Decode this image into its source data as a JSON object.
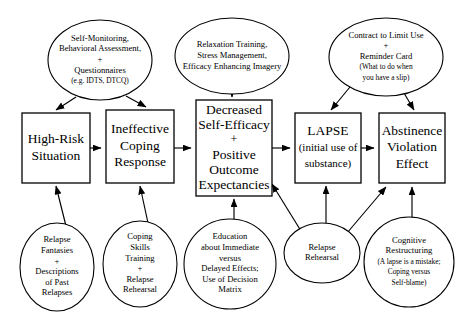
{
  "diagram": {
    "type": "flow-diagram",
    "canvas": {
      "width": 465,
      "height": 318
    },
    "colors": {
      "stroke": "#000000",
      "fill": "#ffffff",
      "text": "#000000"
    },
    "boxes": [
      {
        "id": "high-risk-situation",
        "name": "High-Risk Situation",
        "x": 22,
        "y": 113,
        "w": 68,
        "h": 70,
        "lines": [
          {
            "text": "High-Risk",
            "size": "normal"
          },
          {
            "text": "Situation",
            "size": "normal"
          }
        ]
      },
      {
        "id": "ineffective-coping-response",
        "name": "Ineffective Coping Response",
        "x": 106,
        "y": 110,
        "w": 68,
        "h": 73,
        "lines": [
          {
            "text": "Ineffective",
            "size": "normal"
          },
          {
            "text": "Coping",
            "size": "normal"
          },
          {
            "text": "Response",
            "size": "normal"
          }
        ]
      },
      {
        "id": "decreased-self-efficacy",
        "name": "Decreased Self-Efficacy + Positive Outcome Expectancies",
        "x": 196,
        "y": 100,
        "w": 76,
        "h": 96,
        "lines": [
          {
            "text": "Decreased",
            "size": "normal"
          },
          {
            "text": "Self-Efficacy",
            "size": "normal"
          },
          {
            "text": "+",
            "size": "plus"
          },
          {
            "text": "Positive",
            "size": "normal"
          },
          {
            "text": "Outcome",
            "size": "normal"
          },
          {
            "text": "Expectancies",
            "size": "normal"
          }
        ]
      },
      {
        "id": "lapse",
        "name": "LAPSE (initial use of substance)",
        "x": 295,
        "y": 113,
        "w": 66,
        "h": 70,
        "lines": [
          {
            "text": "LAPSE",
            "size": "normal"
          },
          {
            "text": "(initial use of",
            "size": "small"
          },
          {
            "text": "substance)",
            "size": "small"
          }
        ]
      },
      {
        "id": "abstinence-violation-effect",
        "name": "Abstinence Violation Effect",
        "x": 379,
        "y": 113,
        "w": 66,
        "h": 70,
        "lines": [
          {
            "text": "Abstinence",
            "size": "normal"
          },
          {
            "text": "Violation",
            "size": "normal"
          },
          {
            "text": "Effect",
            "size": "normal"
          }
        ]
      }
    ],
    "ellipses": [
      {
        "id": "self-monitoring",
        "name": "Self-Monitoring, Behavioral Assessment + Questionnaires",
        "cx": 100,
        "cy": 60,
        "rx": 52,
        "ry": 40,
        "lines": [
          {
            "text": "Self-Monitoring,",
            "size": "normal"
          },
          {
            "text": "Behavioral Assessment,",
            "size": "normal"
          },
          {
            "text": "+",
            "size": "plus"
          },
          {
            "text": "Questionnaires",
            "size": "normal"
          },
          {
            "text": "(e.g. IDTS, DTCQ)",
            "size": "tiny"
          }
        ]
      },
      {
        "id": "relaxation-training",
        "name": "Relaxation Training, Stress Management, Efficacy Enhancing Imagery",
        "cx": 232,
        "cy": 56,
        "rx": 57,
        "ry": 38,
        "lines": [
          {
            "text": "Relaxation Training,",
            "size": "normal"
          },
          {
            "text": "Stress Management,",
            "size": "normal"
          },
          {
            "text": "Efficacy Enhancing Imagery",
            "size": "normal"
          }
        ]
      },
      {
        "id": "contract-to-limit-use",
        "name": "Contract to Limit Use + Reminder Card",
        "cx": 386,
        "cy": 57,
        "rx": 57,
        "ry": 39,
        "lines": [
          {
            "text": "Contract to Limit Use",
            "size": "normal"
          },
          {
            "text": "+",
            "size": "plus"
          },
          {
            "text": "Reminder Card",
            "size": "normal"
          },
          {
            "text": "(What to do when",
            "size": "tiny"
          },
          {
            "text": "you have a slip)",
            "size": "tiny"
          }
        ]
      },
      {
        "id": "relapse-fantasies",
        "name": "Relapse Fantasies + Descriptions of Past Relapses",
        "cx": 57,
        "cy": 267,
        "rx": 37,
        "ry": 44,
        "lines": [
          {
            "text": "Relapse",
            "size": "normal"
          },
          {
            "text": "Fantasies",
            "size": "normal"
          },
          {
            "text": "+",
            "size": "plus"
          },
          {
            "text": "Descriptions",
            "size": "normal"
          },
          {
            "text": "of Past",
            "size": "normal"
          },
          {
            "text": "Relapses",
            "size": "normal"
          }
        ]
      },
      {
        "id": "coping-skills-training",
        "name": "Coping Skills Training + Relapse Rehearsal",
        "cx": 140,
        "cy": 264,
        "rx": 37,
        "ry": 43,
        "lines": [
          {
            "text": "Coping",
            "size": "normal"
          },
          {
            "text": "Skills",
            "size": "normal"
          },
          {
            "text": "Training",
            "size": "normal"
          },
          {
            "text": "+",
            "size": "plus"
          },
          {
            "text": "Relapse",
            "size": "normal"
          },
          {
            "text": "Rehearsal",
            "size": "normal"
          }
        ]
      },
      {
        "id": "education-immediate-delayed",
        "name": "Education about Immediate versus Delayed Effects; Use of Decision Matrix",
        "cx": 230,
        "cy": 264,
        "rx": 46,
        "ry": 45,
        "lines": [
          {
            "text": "Education",
            "size": "normal"
          },
          {
            "text": "about Immediate",
            "size": "normal"
          },
          {
            "text": "versus",
            "size": "normal"
          },
          {
            "text": "Delayed Effects;",
            "size": "normal"
          },
          {
            "text": "Use of Decision",
            "size": "normal"
          },
          {
            "text": "Matrix",
            "size": "normal"
          }
        ]
      },
      {
        "id": "relapse-rehearsal",
        "name": "Relapse Rehearsal",
        "cx": 322,
        "cy": 253,
        "rx": 38,
        "ry": 30,
        "lines": [
          {
            "text": "Relapse",
            "size": "normal"
          },
          {
            "text": "Rehearsal",
            "size": "normal"
          }
        ]
      },
      {
        "id": "cognitive-restructuring",
        "name": "Cognitive Restructuring",
        "cx": 409,
        "cy": 262,
        "rx": 45,
        "ry": 45,
        "lines": [
          {
            "text": "Cognitive",
            "size": "normal"
          },
          {
            "text": "Restructuring",
            "size": "normal"
          },
          {
            "text": "(A lapse is a mistake;",
            "size": "tiny"
          },
          {
            "text": "Coping versus",
            "size": "tiny"
          },
          {
            "text": "Self-blame)",
            "size": "tiny"
          }
        ]
      }
    ],
    "edges": [
      {
        "id": "e-hrs-to-icr",
        "from": "high-risk-situation",
        "to": "ineffective-coping-response",
        "d": "M 90,148 L 101,148",
        "arrow": true
      },
      {
        "id": "e-icr-to-dse",
        "from": "ineffective-coping-response",
        "to": "decreased-self-efficacy",
        "d": "M 174,148 L 191,148",
        "arrow": true
      },
      {
        "id": "e-dse-to-lapse",
        "from": "decreased-self-efficacy",
        "to": "lapse",
        "d": "M 272,148 L 290,148",
        "arrow": true
      },
      {
        "id": "e-lapse-to-ave",
        "from": "lapse",
        "to": "abstinence-violation-effect",
        "d": "M 361,148 L 374,148",
        "arrow": true
      },
      {
        "id": "e-selfmon-to-hrs",
        "from": "self-monitoring",
        "to": "high-risk-situation",
        "d": "M 76,97 L 56,110",
        "arrow": true
      },
      {
        "id": "e-selfmon-to-icr",
        "from": "self-monitoring",
        "to": "ineffective-coping-response",
        "d": "M 126,96 L 146,107",
        "arrow": true
      },
      {
        "id": "e-relax-to-dse",
        "from": "relaxation-training",
        "to": "decreased-self-efficacy",
        "d": "M 232,94 L 232,97",
        "arrow": true
      },
      {
        "id": "e-contract-to-lapse",
        "from": "contract-to-limit-use",
        "to": "lapse",
        "d": "M 350,87 L 331,110",
        "arrow": true
      },
      {
        "id": "e-contract-to-ave",
        "from": "contract-to-limit-use",
        "to": "abstinence-violation-effect",
        "d": "M 404,93 L 414,110",
        "arrow": true
      },
      {
        "id": "e-fantasies-to-hrs",
        "from": "relapse-fantasies",
        "to": "high-risk-situation",
        "d": "M 66,226 L 56,186",
        "arrow": true
      },
      {
        "id": "e-coping-to-icr",
        "from": "coping-skills-training",
        "to": "ineffective-coping-response",
        "d": "M 148,223 L 140,186",
        "arrow": true
      },
      {
        "id": "e-education-to-dse",
        "from": "education-immediate-delayed",
        "to": "decreased-self-efficacy",
        "d": "M 234,220 L 234,199",
        "arrow": true
      },
      {
        "id": "e-rehearsal-to-dse",
        "from": "relapse-rehearsal",
        "to": "decreased-self-efficacy",
        "d": "M 301,231 L 272,184",
        "arrow": true
      },
      {
        "id": "e-rehearsal-to-lapse",
        "from": "relapse-rehearsal",
        "to": "lapse",
        "d": "M 326,223 L 326,186",
        "arrow": true
      },
      {
        "id": "e-rehearsal-to-ave",
        "from": "relapse-rehearsal",
        "to": "abstinence-violation-effect",
        "d": "M 347,233 L 386,187",
        "arrow": true
      },
      {
        "id": "e-cognitive-to-ave",
        "from": "cognitive-restructuring",
        "to": "abstinence-violation-effect",
        "d": "M 412,217 L 412,187",
        "arrow": true
      }
    ]
  }
}
